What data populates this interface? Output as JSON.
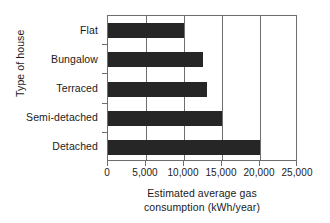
{
  "chart_data": {
    "type": "bar",
    "orientation": "horizontal",
    "title": "",
    "xlabel_line1": "Estimated average gas",
    "xlabel_line2": "consumption (kWh/year)",
    "ylabel": "Type of house",
    "categories": [
      "Flat",
      "Bungalow",
      "Terraced",
      "Semi-detached",
      "Detached"
    ],
    "values": [
      10000,
      12500,
      13000,
      15000,
      20000
    ],
    "xlim": [
      0,
      25000
    ],
    "xticks": [
      0,
      5000,
      10000,
      15000,
      20000,
      25000
    ],
    "xtick_labels": [
      "0",
      "5,000",
      "10,000",
      "15,000",
      "20,000",
      "25,000"
    ],
    "grid": "vertical",
    "legend": "none",
    "bar_color": "#262626",
    "frame_color": "#6e6e6e",
    "background": "#ffffff"
  }
}
